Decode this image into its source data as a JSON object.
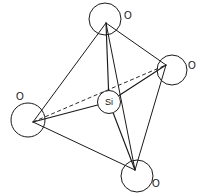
{
  "diagram": {
    "type": "molecular-structure",
    "background_color": "#ffffff",
    "line_color": "#1a1a1a",
    "center_atom": {
      "label": "Si",
      "name": "silicon",
      "cx": 109,
      "cy": 102,
      "r": 11.5
    },
    "vertex_atoms": [
      {
        "label": "O",
        "name": "oxygen-top",
        "cx": 105,
        "cy": 19,
        "r": 16,
        "bond_x": 106,
        "bond_y": 23,
        "label_x": 124,
        "label_y": 11
      },
      {
        "label": "O",
        "name": "oxygen-right",
        "cx": 172,
        "cy": 70,
        "r": 15,
        "bond_x": 166,
        "bond_y": 65,
        "label_x": 188,
        "label_y": 61
      },
      {
        "label": "O",
        "name": "oxygen-left",
        "cx": 28,
        "cy": 120,
        "r": 17,
        "bond_x": 33,
        "bond_y": 122,
        "label_x": 16,
        "label_y": 92
      },
      {
        "label": "O",
        "name": "oxygen-bottom",
        "cx": 137,
        "cy": 176,
        "r": 16,
        "bond_x": 135,
        "bond_y": 170,
        "label_x": 152,
        "label_y": 179
      }
    ],
    "bonds": [
      {
        "name": "bond-si-o-top",
        "x1": 109,
        "y1": 102,
        "x2": 106,
        "y2": 23,
        "style": "solid"
      },
      {
        "name": "bond-si-o-right",
        "x1": 109,
        "y1": 102,
        "x2": 166,
        "y2": 65,
        "style": "solid"
      },
      {
        "name": "bond-si-o-left",
        "x1": 109,
        "y1": 102,
        "x2": 33,
        "y2": 122,
        "style": "solid"
      },
      {
        "name": "bond-si-o-bottom",
        "x1": 109,
        "y1": 102,
        "x2": 135,
        "y2": 170,
        "style": "solid"
      }
    ],
    "edges": [
      {
        "name": "edge-top-left",
        "x1": 106,
        "y1": 23,
        "x2": 33,
        "y2": 122,
        "style": "solid"
      },
      {
        "name": "edge-top-right",
        "x1": 106,
        "y1": 23,
        "x2": 166,
        "y2": 65,
        "style": "solid"
      },
      {
        "name": "edge-top-bottom",
        "x1": 106,
        "y1": 23,
        "x2": 135,
        "y2": 170,
        "style": "solid"
      },
      {
        "name": "edge-left-bottom",
        "x1": 33,
        "y1": 122,
        "x2": 135,
        "y2": 170,
        "style": "solid"
      },
      {
        "name": "edge-right-bottom",
        "x1": 166,
        "y1": 65,
        "x2": 135,
        "y2": 170,
        "style": "solid"
      },
      {
        "name": "edge-left-right",
        "x1": 33,
        "y1": 122,
        "x2": 166,
        "y2": 65,
        "style": "dashed"
      }
    ]
  }
}
